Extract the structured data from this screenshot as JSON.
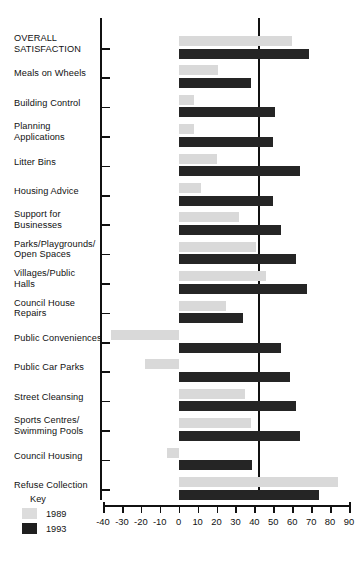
{
  "chart_data": {
    "type": "bar",
    "orientation": "horizontal",
    "title": "",
    "xlabel": "",
    "ylabel": "",
    "xlim": [
      -40,
      90
    ],
    "xticks": [
      -40,
      -30,
      -20,
      -10,
      0,
      10,
      20,
      30,
      40,
      50,
      60,
      70,
      80,
      90
    ],
    "xtick_labels": [
      "-40",
      "-30",
      "-20",
      "-10",
      "0",
      "10",
      "20",
      "30",
      "40",
      "50",
      "60",
      "70",
      "80",
      "90"
    ],
    "grid": false,
    "legend_position": "bottom-left",
    "legend_title": "Key",
    "categories": [
      "OVERALL\nSATISFACTION",
      "Meals on Wheels",
      "Building Control",
      "Planning\nApplications",
      "Litter Bins",
      "Housing Advice",
      "Support for\nBusinesses",
      "Parks/Playgrounds/\nOpen Spaces",
      "Villages/Public\nHalls",
      "Council House\nRepairs",
      "Public Conveniences",
      "Public Car Parks",
      "Street Cleansing",
      "Sports Centres/\nSwimming Pools",
      "Council Housing",
      "Refuse Collection"
    ],
    "series": [
      {
        "name": "1989",
        "color": "#d9d9d9",
        "values": [
          60,
          21,
          8,
          8,
          20,
          12,
          32,
          41,
          46,
          25,
          -36,
          -18,
          35,
          38,
          -6,
          84
        ]
      },
      {
        "name": "1993",
        "color": "#252525",
        "values": [
          69,
          38,
          51,
          50,
          64,
          50,
          54,
          62,
          68,
          34,
          54,
          59,
          62,
          64,
          39,
          74
        ]
      }
    ]
  },
  "legend": {
    "title": "Key",
    "entries": [
      {
        "label": "1989",
        "color": "#dcdcdc"
      },
      {
        "label": "1993",
        "color": "#1f1f1f"
      }
    ]
  }
}
